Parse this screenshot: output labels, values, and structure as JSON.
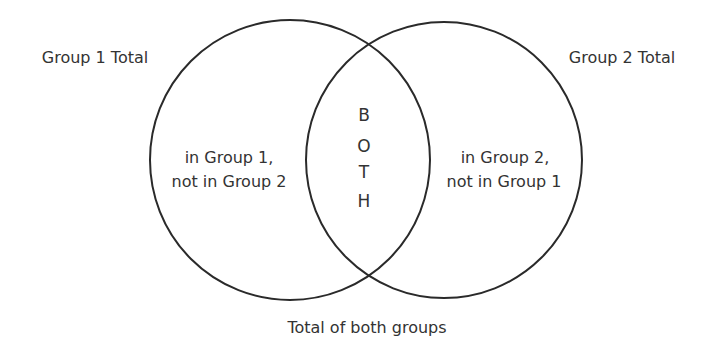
{
  "diagram": {
    "type": "venn",
    "colors": {
      "stroke": "#2a2a2a",
      "text": "#333333",
      "background": "#ffffff"
    },
    "circles": [
      {
        "name": "Group 1",
        "cx": 290,
        "cy": 160,
        "r": 140
      },
      {
        "name": "Group 2",
        "cx": 444,
        "cy": 160,
        "r": 138
      }
    ],
    "labels": {
      "group1_total": "Group 1 Total",
      "group2_total": "Group 2 Total",
      "group1_only_line1": "in Group 1,",
      "group1_only_line2": "not in Group 2",
      "group2_only_line1": "in Group 2,",
      "group2_only_line2": "not in Group 1",
      "both_letters": [
        "B",
        "O",
        "T",
        "H"
      ],
      "total_both": "Total of both groups"
    }
  }
}
